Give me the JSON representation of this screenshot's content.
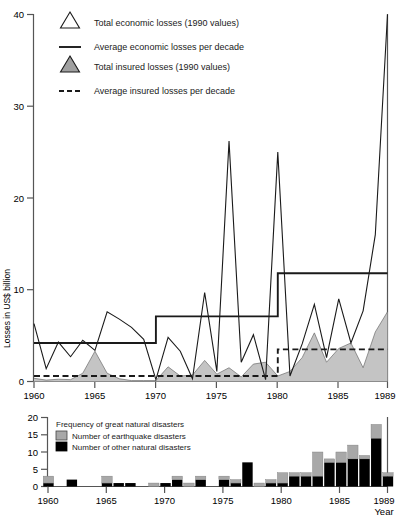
{
  "chart_data": [
    {
      "type": "line",
      "id": "losses-chart",
      "title": "",
      "xlabel": "",
      "ylabel": "Losses in US$ billion",
      "ylim": [
        0,
        40
      ],
      "xlim": [
        1960,
        1989
      ],
      "yticks": [
        0,
        10,
        20,
        30,
        40
      ],
      "ytick_labels": [
        "0",
        "10",
        "20",
        "30",
        "40"
      ],
      "xticks": [
        1960,
        1965,
        1970,
        1975,
        1980,
        1985,
        1989
      ],
      "xtick_labels": [
        "1960",
        "1965",
        "1970",
        "1975",
        "1980",
        "1985",
        "1989"
      ],
      "grid": false,
      "legend_position": "top-left",
      "x": [
        1960,
        1961,
        1962,
        1963,
        1964,
        1965,
        1966,
        1967,
        1968,
        1969,
        1970,
        1971,
        1972,
        1973,
        1974,
        1975,
        1976,
        1977,
        1978,
        1979,
        1980,
        1981,
        1982,
        1983,
        1984,
        1985,
        1986,
        1987,
        1988,
        1989
      ],
      "series": [
        {
          "name": "Total economic losses (1990 values)",
          "marker": "open-triangle",
          "style": "solid-thin",
          "values": [
            6.3,
            1.4,
            4.3,
            2.7,
            4.5,
            3.4,
            7.6,
            6.8,
            5.9,
            4.6,
            0.2,
            4.8,
            3.3,
            0.3,
            9.7,
            1.1,
            26.2,
            2.1,
            5.1,
            0.2,
            25.0,
            0.6,
            4.1,
            8.4,
            2.6,
            9.0,
            4.2,
            7.7,
            16.0,
            40.0
          ]
        },
        {
          "name": "Average economic losses per decade",
          "style": "solid-thick-step",
          "decades": [
            "1960-1969",
            "1970-1979",
            "1980-1989"
          ],
          "decade_values": [
            4.2,
            7.1,
            11.8
          ]
        },
        {
          "name": "Total insured losses (1990 values)",
          "marker": "filled-triangle",
          "style": "filled-area",
          "values": [
            0.35,
            0.15,
            0.25,
            0.2,
            0.9,
            3.3,
            0.9,
            0.3,
            0.1,
            0.1,
            0.1,
            1.6,
            0.6,
            0.7,
            2.3,
            0.8,
            1.5,
            0.5,
            1.9,
            2.1,
            0.6,
            1.1,
            2.6,
            5.3,
            2.1,
            3.6,
            4.2,
            1.5,
            5.4,
            7.6
          ]
        },
        {
          "name": "Average insured losses per decade",
          "style": "dashed-step",
          "decades": [
            "1960-1969",
            "1970-1979",
            "1980-1989"
          ],
          "decade_values": [
            0.6,
            0.6,
            3.5
          ]
        }
      ]
    },
    {
      "type": "bar",
      "id": "frequency-chart",
      "title": "Frequency of great natural disasters",
      "xlabel": "Year",
      "ylabel": "",
      "ylim": [
        0,
        20
      ],
      "xlim": [
        1960,
        1989
      ],
      "yticks": [
        0,
        5,
        10,
        15,
        20
      ],
      "ytick_labels": [
        "0",
        "5",
        "10",
        "15",
        "20"
      ],
      "xticks": [
        1960,
        1965,
        1970,
        1975,
        1980,
        1985,
        1989
      ],
      "xtick_labels": [
        "1960",
        "1965",
        "1970",
        "1975",
        "1980",
        "1985",
        "1989"
      ],
      "stacked": true,
      "grid": false,
      "legend_position": "top-left",
      "categories": [
        1960,
        1961,
        1962,
        1963,
        1964,
        1965,
        1966,
        1967,
        1968,
        1969,
        1970,
        1971,
        1972,
        1973,
        1974,
        1975,
        1976,
        1977,
        1978,
        1979,
        1980,
        1981,
        1982,
        1983,
        1984,
        1985,
        1986,
        1987,
        1988,
        1989
      ],
      "series": [
        {
          "name": "Number of other natural disasters",
          "color": "#000000",
          "values": [
            1,
            0,
            2,
            0,
            0,
            1,
            1,
            1,
            0,
            0,
            1,
            2,
            0,
            2,
            0,
            2,
            1,
            7,
            0,
            1,
            1,
            3,
            3,
            3,
            7,
            7,
            8,
            8,
            14,
            3
          ]
        },
        {
          "name": "Number of earthquake disasters",
          "color": "#a8a8a8",
          "values": [
            2,
            0,
            0,
            0,
            0,
            2,
            0,
            0,
            0,
            1,
            0,
            1,
            1,
            1,
            0,
            1,
            1,
            0,
            1,
            1,
            3,
            1,
            1,
            7,
            1,
            3,
            4,
            1,
            4,
            1
          ]
        }
      ]
    }
  ],
  "losses_chart": {
    "ylabel": "Losses in US$ billion",
    "ytick_labels": [
      "40",
      "30",
      "20",
      "10",
      "0"
    ],
    "xtick_labels": [
      "1960",
      "1965",
      "1970",
      "1975",
      "1980",
      "1985",
      "1989"
    ],
    "legend": [
      {
        "label": "Total economic losses (1990 values)",
        "marker": "open-triangle-icon"
      },
      {
        "label": "Average economic losses per decade",
        "marker": "solid-line-icon"
      },
      {
        "label": "Total insured losses (1990 values)",
        "marker": "filled-triangle-icon"
      },
      {
        "label": "Average insured losses per decade",
        "marker": "dashed-line-icon"
      }
    ]
  },
  "frequency_chart": {
    "ytick_labels": [
      "20",
      "15",
      "10",
      "5",
      "0"
    ],
    "xtick_labels": [
      "1960",
      "1965",
      "1970",
      "1975",
      "1980",
      "1985",
      "1989"
    ],
    "xlabel": "Year",
    "legend_title": "Frequency of great natural disasters",
    "legend": [
      {
        "label": "Number of earthquake disasters",
        "swatch": "gray-swatch-icon"
      },
      {
        "label": "Number of other natural disasters",
        "swatch": "black-swatch-icon"
      }
    ]
  },
  "colors": {
    "line": "#1a1a1a",
    "insured_fill": "#c4c4c4",
    "earthquake": "#a8a8a8",
    "other": "#000000",
    "axis": "#555555"
  }
}
